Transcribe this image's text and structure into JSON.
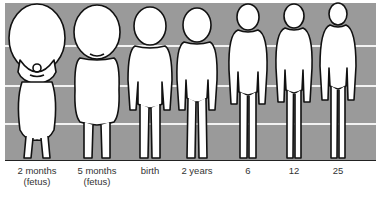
{
  "figure": {
    "background_color": "#9a9a9a",
    "stripe_color": "#f2f2f2",
    "stages": [
      {
        "label": "2 months",
        "sublabel": "(fetus)",
        "x": 37
      },
      {
        "label": "5 months",
        "sublabel": "(fetus)",
        "x": 97
      },
      {
        "label": "birth",
        "sublabel": "",
        "x": 150
      },
      {
        "label": "2 years",
        "sublabel": "",
        "x": 197
      },
      {
        "label": "6",
        "sublabel": "",
        "x": 248
      },
      {
        "label": "12",
        "sublabel": "",
        "x": 294
      },
      {
        "label": "25",
        "sublabel": "",
        "x": 338
      }
    ]
  }
}
